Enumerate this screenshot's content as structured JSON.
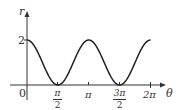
{
  "chart_data": {
    "type": "line",
    "title": "",
    "function": "r = 1 + cos(2θ)",
    "xlabel": "θ",
    "ylabel": "r",
    "x_ticks": [
      "π/2",
      "π",
      "3π/2",
      "2π"
    ],
    "y_ticks": [
      "2"
    ],
    "origin_label": "0",
    "xlim": [
      0,
      6.283
    ],
    "ylim": [
      0,
      2
    ],
    "grid": false,
    "legend": null,
    "series": [
      {
        "name": "r(θ)",
        "x": [
          0,
          0.785,
          1.571,
          2.356,
          3.142,
          3.927,
          4.712,
          5.498,
          6.283
        ],
        "values": [
          2,
          1,
          0,
          1,
          2,
          1,
          0,
          1,
          2
        ]
      }
    ]
  },
  "labels": {
    "y_axis": "r",
    "x_axis": "θ",
    "origin": "0",
    "y_tick_2": "2",
    "pi_half_num": "π",
    "pi_half_den": "2",
    "pi": "π",
    "three_pi_half_num": "3π",
    "three_pi_half_den": "2",
    "two_pi": "2π"
  }
}
